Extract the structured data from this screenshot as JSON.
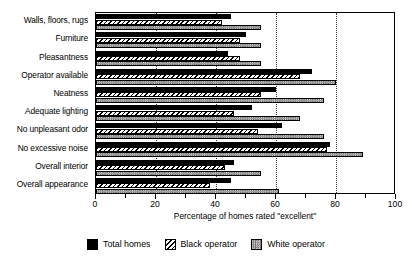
{
  "chart_data": {
    "type": "bar",
    "orientation": "horizontal",
    "title": "",
    "xlabel": "Percentage of homes rated \"excellent\"",
    "ylabel": "",
    "xlim": [
      0,
      100
    ],
    "xticks": [
      0,
      20,
      40,
      60,
      80,
      100
    ],
    "xtick_labels": [
      "0",
      "20",
      "40",
      "60",
      "80",
      "100"
    ],
    "minor_tick_interval": 10,
    "grid": "vertical-dotted",
    "legend_position": "bottom-center",
    "categories": [
      "Walls, floors, rugs",
      "Furniture",
      "Pleasantness",
      "Operator available",
      "Neatness",
      "Adequate lighting",
      "No unpleasant odor",
      "No excessive noise",
      "Overall interior",
      "Overall appearance"
    ],
    "series": [
      {
        "name": "Total homes",
        "style": "solid-black",
        "color": "#000000",
        "values": [
          45,
          50,
          44,
          72,
          60,
          52,
          62,
          78,
          46,
          45
        ]
      },
      {
        "name": "Black operator",
        "style": "diagonal-hatch",
        "color": "#000000",
        "values": [
          42,
          48,
          48,
          68,
          55,
          46,
          54,
          77,
          43,
          38
        ]
      },
      {
        "name": "White operator",
        "style": "stipple-gray",
        "color": "#8a8a8a",
        "values": [
          55,
          55,
          55,
          80,
          76,
          68,
          76,
          89,
          55,
          61
        ]
      }
    ],
    "legend": [
      {
        "label": "Total homes",
        "swatch": "solid-black-swatch"
      },
      {
        "label": "Black operator",
        "swatch": "diagonal-hatch-swatch"
      },
      {
        "label": "White operator",
        "swatch": "stipple-gray-swatch"
      }
    ]
  }
}
